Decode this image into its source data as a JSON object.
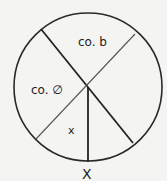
{
  "diagram": {
    "colors": {
      "background": "#f4f4f2",
      "stroke": "#2a2a2a"
    },
    "circle": {
      "cx": 88,
      "cy": 87,
      "r": 74
    },
    "labels": {
      "top_sector": "co. b",
      "left_sector": "co. ∅",
      "bottom_sector": "x",
      "bottom_marker": "X"
    }
  }
}
